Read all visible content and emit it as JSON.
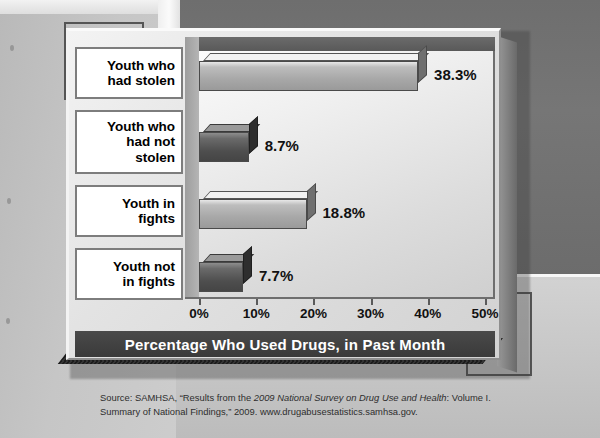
{
  "chart_data": {
    "type": "bar",
    "orientation": "horizontal",
    "title": "Percentage Who Used Drugs, in Past Month",
    "xlabel": "Percentage Who Used Drugs, in Past Month",
    "ylabel": "",
    "xlim": [
      0,
      50
    ],
    "xticks": [
      "0%",
      "10%",
      "20%",
      "30%",
      "40%",
      "50%"
    ],
    "xtick_values": [
      0,
      10,
      20,
      30,
      40,
      50
    ],
    "grid": false,
    "legend": "none",
    "categories": [
      "Youth who had stolen",
      "Youth who had not stolen",
      "Youth in fights",
      "Youth not in fights"
    ],
    "values": [
      38.3,
      8.7,
      18.8,
      7.7
    ],
    "value_labels": [
      "38.3%",
      "8.7%",
      "18.8%",
      "7.7%"
    ],
    "bar_styles": [
      "light",
      "dark",
      "light",
      "dark"
    ]
  },
  "chart": {
    "categories": [
      {
        "lines": [
          "Youth who",
          "had stolen"
        ]
      },
      {
        "lines": [
          "Youth who",
          "had not",
          "stolen"
        ]
      },
      {
        "lines": [
          "Youth in",
          "fights"
        ]
      },
      {
        "lines": [
          "Youth not",
          "in fights"
        ]
      }
    ],
    "title_bar": "Percentage Who Used Drugs, in Past Month"
  },
  "source": {
    "line1_pre": "Source: SAMHSA, “Results from the ",
    "line1_italic": "2009 National Survey on Drug Use and Health",
    "line1_post": ": Volume I.",
    "line2": "Summary of National Findings,” 2009. www.drugabusestatistics.samhsa.gov."
  },
  "colors": {
    "bar_light": "#a8a8a8",
    "bar_dark": "#4e4e4e",
    "title_bar_bg": "#3f3f3f",
    "plot_bg": "#ececec",
    "background_dark_band": "#727272"
  }
}
